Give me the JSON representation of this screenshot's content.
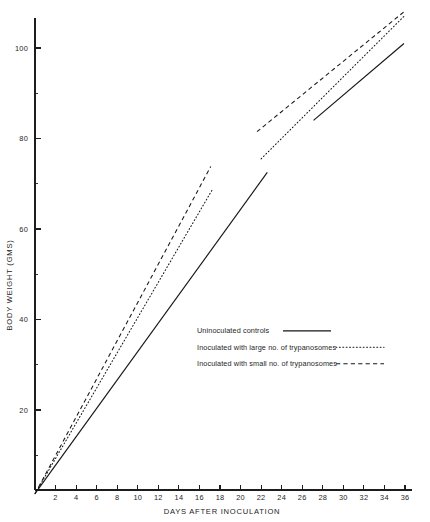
{
  "chart_data": {
    "type": "line",
    "title": "",
    "xlabel": "DAYS AFTER INOCULATION",
    "ylabel": "BODY WEIGHT (GMS)",
    "xlim": [
      0,
      36
    ],
    "ylim": [
      0,
      108
    ],
    "grid": false,
    "legend_position": "center-right",
    "x_ticks_major": [
      2,
      4,
      6,
      8,
      10,
      12,
      14,
      16,
      18,
      20,
      22,
      24,
      26,
      28,
      30,
      32,
      34,
      36
    ],
    "x_tick_labels": [
      "2",
      "4",
      "6",
      "8",
      "10",
      "12",
      "14",
      "16",
      "18",
      "20",
      "22",
      "24",
      "26",
      "28",
      "30",
      "32",
      "34",
      "36"
    ],
    "y_ticks_major": [
      20,
      40,
      60,
      80,
      100
    ],
    "y_tick_labels": [
      "20",
      "40",
      "60",
      "80",
      "100"
    ],
    "y_ticks_minor": [
      10,
      30,
      50,
      70,
      90
    ],
    "series": [
      {
        "name": "Uninoculated controls",
        "style": "solid",
        "segments": [
          {
            "x": [
              0,
              22.6
            ],
            "y": [
              1.5,
              72.5
            ]
          },
          {
            "x": [
              27.1,
              35.9
            ],
            "y": [
              84.0,
              101.0
            ]
          }
        ]
      },
      {
        "name": "Inoculated with large no. of trypanosomes",
        "style": "dotted",
        "segments": [
          {
            "x": [
              0,
              17.2
            ],
            "y": [
              1.5,
              68.5
            ]
          },
          {
            "x": [
              22.0,
              35.9
            ],
            "y": [
              75.5,
              107.0
            ]
          }
        ]
      },
      {
        "name": "Inoculated with small no. of trypanosomes",
        "style": "dashed",
        "segments": [
          {
            "x": [
              0,
              17.1
            ],
            "y": [
              1.5,
              73.8
            ]
          },
          {
            "x": [
              21.6,
              35.9
            ],
            "y": [
              81.5,
              108.0
            ]
          }
        ]
      }
    ]
  },
  "legend": {
    "entries": [
      {
        "label": "Uninoculated controls",
        "style": "solid"
      },
      {
        "label": "Inoculated with large no. of trypanosomes",
        "style": "dotted"
      },
      {
        "label": "Inoculated with small no. of trypanosomes",
        "style": "dashed"
      }
    ]
  },
  "axes": {
    "x_title": "DAYS AFTER INOCULATION",
    "y_title": "BODY WEIGHT (GMS)"
  },
  "colors": {
    "ink": "#161616",
    "paper": "#ffffff"
  }
}
